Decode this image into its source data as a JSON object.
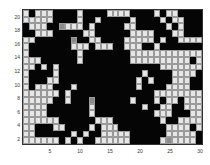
{
  "chart_data": {
    "type": "heatmap",
    "title": "",
    "xlabel": "",
    "ylabel": "",
    "xlim": [
      0.5,
      30.5
    ],
    "ylim": [
      0.5,
      20.5
    ],
    "x_ticks": [
      "5",
      "10",
      "15",
      "20",
      "25",
      "30"
    ],
    "y_ticks": [
      "2",
      "4",
      "6",
      "8",
      "10",
      "12",
      "14",
      "16",
      "18",
      "20"
    ],
    "colormap": {
      "0": "#e6e6e6",
      "1": "#050505",
      "2": "#8a8a8a"
    },
    "legend": "none",
    "rows_top_to_bottom": [
      [
        0,
        1,
        0,
        0,
        0,
        1,
        1,
        1,
        1,
        0,
        1,
        1,
        1,
        1,
        0,
        0,
        0,
        0,
        1,
        1,
        1,
        1,
        0,
        1,
        0,
        0,
        1,
        1,
        1,
        1
      ],
      [
        0,
        0,
        0,
        0,
        0,
        1,
        1,
        1,
        1,
        0,
        1,
        1,
        0,
        1,
        1,
        1,
        1,
        1,
        0,
        1,
        1,
        1,
        1,
        0,
        1,
        0,
        0,
        1,
        1,
        1
      ],
      [
        1,
        0,
        0,
        0,
        1,
        1,
        2,
        0,
        0,
        0,
        1,
        0,
        1,
        1,
        1,
        1,
        1,
        0,
        0,
        1,
        1,
        1,
        1,
        1,
        0,
        1,
        0,
        1,
        1,
        1
      ],
      [
        1,
        1,
        0,
        0,
        0,
        1,
        1,
        1,
        1,
        1,
        0,
        0,
        1,
        1,
        1,
        1,
        1,
        1,
        0,
        0,
        0,
        0,
        1,
        1,
        1,
        0,
        0,
        1,
        1,
        1
      ],
      [
        0,
        0,
        1,
        1,
        1,
        1,
        1,
        1,
        2,
        1,
        1,
        0,
        0,
        1,
        1,
        1,
        1,
        0,
        0,
        0,
        0,
        0,
        1,
        0,
        1,
        1,
        0,
        0,
        0,
        0
      ],
      [
        0,
        1,
        1,
        1,
        1,
        1,
        1,
        1,
        0,
        0,
        0,
        1,
        0,
        0,
        0,
        1,
        1,
        0,
        0,
        0,
        1,
        1,
        0,
        1,
        1,
        1,
        1,
        1,
        1,
        1
      ],
      [
        0,
        1,
        1,
        1,
        1,
        1,
        1,
        1,
        1,
        0,
        1,
        1,
        1,
        1,
        1,
        1,
        1,
        1,
        0,
        0,
        0,
        0,
        0,
        0,
        0,
        0,
        0,
        0,
        0,
        0
      ],
      [
        0,
        0,
        0,
        1,
        1,
        1,
        1,
        1,
        1,
        0,
        1,
        1,
        1,
        1,
        1,
        1,
        1,
        1,
        0,
        0,
        0,
        0,
        0,
        0,
        0,
        0,
        0,
        0,
        1,
        0
      ],
      [
        0,
        0,
        1,
        0,
        1,
        0,
        1,
        1,
        1,
        1,
        1,
        1,
        1,
        1,
        1,
        1,
        1,
        1,
        1,
        1,
        1,
        1,
        1,
        0,
        0,
        0,
        0,
        0,
        0,
        0
      ],
      [
        0,
        1,
        1,
        1,
        1,
        0,
        1,
        1,
        1,
        1,
        1,
        1,
        1,
        1,
        1,
        1,
        1,
        1,
        1,
        1,
        0,
        1,
        1,
        1,
        1,
        0,
        0,
        0,
        0,
        1
      ],
      [
        0,
        1,
        1,
        1,
        0,
        0,
        1,
        1,
        1,
        1,
        1,
        1,
        1,
        1,
        1,
        1,
        1,
        1,
        1,
        0,
        1,
        0,
        1,
        1,
        1,
        0,
        0,
        0,
        1,
        1
      ],
      [
        0,
        1,
        0,
        0,
        0,
        1,
        1,
        1,
        0,
        1,
        1,
        1,
        1,
        1,
        1,
        1,
        1,
        1,
        1,
        0,
        1,
        1,
        1,
        1,
        0,
        0,
        0,
        0,
        1,
        1
      ],
      [
        0,
        0,
        0,
        0,
        0,
        0,
        1,
        0,
        1,
        1,
        1,
        1,
        1,
        1,
        1,
        1,
        1,
        1,
        1,
        1,
        1,
        1,
        0,
        0,
        0,
        0,
        0,
        0,
        0,
        0
      ],
      [
        0,
        0,
        0,
        0,
        0,
        1,
        1,
        0,
        1,
        1,
        1,
        2,
        1,
        1,
        1,
        1,
        1,
        1,
        0,
        1,
        1,
        1,
        0,
        1,
        0,
        0,
        1,
        0,
        0,
        0
      ],
      [
        0,
        0,
        0,
        0,
        1,
        1,
        1,
        1,
        1,
        1,
        1,
        0,
        1,
        1,
        1,
        1,
        1,
        1,
        1,
        1,
        0,
        1,
        1,
        0,
        0,
        1,
        1,
        0,
        0,
        0
      ],
      [
        0,
        0,
        0,
        0,
        1,
        1,
        1,
        1,
        1,
        1,
        1,
        0,
        1,
        1,
        1,
        1,
        1,
        1,
        1,
        1,
        1,
        1,
        0,
        0,
        0,
        1,
        1,
        1,
        0,
        0
      ],
      [
        0,
        0,
        0,
        0,
        0,
        0,
        1,
        1,
        1,
        1,
        1,
        1,
        0,
        0,
        0,
        1,
        1,
        1,
        1,
        1,
        1,
        1,
        1,
        0,
        1,
        1,
        0,
        0,
        0,
        0
      ],
      [
        0,
        0,
        1,
        1,
        1,
        0,
        0,
        1,
        1,
        1,
        1,
        0,
        1,
        0,
        0,
        0,
        1,
        1,
        1,
        1,
        1,
        1,
        1,
        1,
        0,
        0,
        0,
        0,
        1,
        0
      ],
      [
        0,
        0,
        1,
        1,
        1,
        1,
        1,
        1,
        0,
        1,
        0,
        1,
        1,
        0,
        0,
        0,
        0,
        0,
        1,
        1,
        1,
        1,
        1,
        1,
        0,
        0,
        0,
        0,
        0,
        1
      ],
      [
        0,
        0,
        0,
        0,
        0,
        0,
        1,
        0,
        1,
        0,
        1,
        1,
        0,
        0,
        0,
        0,
        0,
        0,
        1,
        1,
        1,
        1,
        1,
        0,
        2,
        0,
        0,
        0,
        0,
        1
      ]
    ]
  }
}
